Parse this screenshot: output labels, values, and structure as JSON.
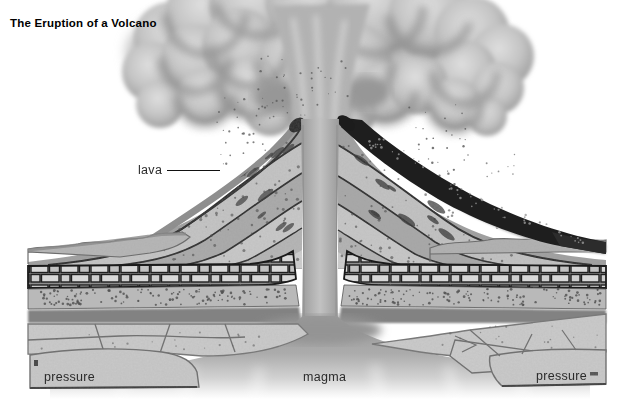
{
  "title": "The Eruption of a Volcano",
  "labels": {
    "lava": "lava",
    "magma": "magma",
    "pressure_left": "pressure",
    "pressure_right": "pressure"
  },
  "colors": {
    "background": "#ffffff",
    "ink": "#1a1a1a",
    "ash_cloud_gray": "#c2c2c2",
    "cloud_shadow_gray": "#8d8d8d",
    "lava_crust_dark": "#1e1e1e",
    "cone_layer_light": "#c9c9c9",
    "cone_layer_mid": "#a8a8a8",
    "magma_gray": "#a0a0a0",
    "block_gray": "#cbcbcb"
  }
}
